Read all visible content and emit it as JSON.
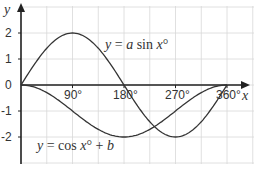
{
  "chart_data": {
    "type": "line",
    "title": "",
    "xlabel": "x",
    "ylabel": "y",
    "xlim": [
      0,
      405
    ],
    "ylim": [
      -3,
      2.6
    ],
    "grid": true,
    "x_ticks": [
      "90°",
      "180°",
      "270°",
      "360°"
    ],
    "x_tick_values": [
      90,
      180,
      270,
      360
    ],
    "y_ticks": [
      "2",
      "1",
      "0",
      "-1",
      "-2"
    ],
    "y_tick_values": [
      2,
      1,
      0,
      -1,
      -2
    ],
    "series": [
      {
        "name": "y = a sin x°",
        "label_parts": [
          "y",
          " = ",
          "a",
          " sin ",
          "x",
          "°"
        ],
        "x": [
          0,
          45,
          90,
          135,
          180,
          225,
          270,
          315,
          360
        ],
        "values": [
          0,
          1.41,
          2,
          1.41,
          0,
          -1.41,
          -2,
          -1.41,
          0
        ]
      },
      {
        "name": "y = cos x° + b",
        "label_parts": [
          "y",
          " = cos ",
          "x",
          "° + ",
          "b"
        ],
        "x": [
          0,
          45,
          90,
          135,
          180,
          225,
          270,
          315,
          360
        ],
        "values": [
          0,
          -0.29,
          -1,
          -1.71,
          -2,
          -1.71,
          -1,
          -0.29,
          0
        ]
      }
    ],
    "annotations": [
      "y = a sin x°",
      "y = cos x° + b"
    ]
  },
  "axes": {
    "x_label": "x",
    "y_label": "y",
    "origin_label": "0"
  },
  "colors": {
    "curve": "#333333",
    "axis": "#222222",
    "grid": "#d8d8d8",
    "text": "#333333"
  }
}
